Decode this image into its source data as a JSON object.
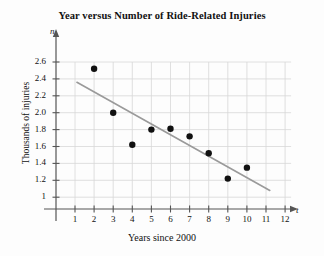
{
  "chart_data": {
    "type": "scatter",
    "title": "Year versus Number of Ride-Related Injuries",
    "xlabel": "Years since 2000",
    "ylabel": "Thousands of injuries",
    "x_axis_symbol": "t",
    "y_axis_symbol": "n",
    "xlim": [
      0,
      12.8
    ],
    "ylim": [
      0.9,
      2.72
    ],
    "grid": true,
    "legend": "none",
    "x_ticks": [
      1,
      2,
      3,
      4,
      5,
      6,
      7,
      8,
      9,
      10,
      11,
      12
    ],
    "x_tick_labels": [
      "1",
      "2",
      "3",
      "4",
      "5",
      "6",
      "7",
      "8",
      "9",
      "10",
      "11",
      "12"
    ],
    "y_ticks": [
      1,
      1.2,
      1.4,
      1.6,
      1.8,
      2.0,
      2.2,
      2.4,
      2.6
    ],
    "y_tick_labels": [
      "1",
      "1.2",
      "1.4",
      "1.6",
      "1.8",
      "2.0",
      "2.2",
      "2.4",
      "2.6"
    ],
    "points": [
      {
        "x": 2,
        "y": 2.52
      },
      {
        "x": 3,
        "y": 2.0
      },
      {
        "x": 4,
        "y": 1.62
      },
      {
        "x": 5,
        "y": 1.8
      },
      {
        "x": 6,
        "y": 1.81
      },
      {
        "x": 7,
        "y": 1.72
      },
      {
        "x": 8,
        "y": 1.52
      },
      {
        "x": 9,
        "y": 1.22
      },
      {
        "x": 10,
        "y": 1.35
      }
    ],
    "trend_line": {
      "x_start": 1.1,
      "y_start": 2.36,
      "x_end": 11.2,
      "y_end": 1.08
    },
    "colors": {
      "point": "#111111",
      "trend_line": "#9a9a9a",
      "axis": "#555555",
      "grid": "#d8d8d8",
      "background": "#fdfdfd",
      "text": "#111111"
    }
  }
}
